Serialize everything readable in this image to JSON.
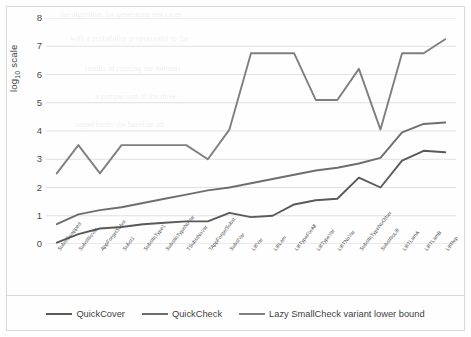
{
  "chart_data": {
    "type": "line",
    "title": "",
    "xlabel": "",
    "ylabel": "log10 scale",
    "ylabel_base": "log",
    "ylabel_sub": "10",
    "ylabel_rest": " scale",
    "ylim": [
      0,
      8
    ],
    "yticks": [
      0,
      1,
      2,
      3,
      4,
      5,
      6,
      7,
      8
    ],
    "grid": "horizontal",
    "legend_position": "bottom",
    "categories": [
      "SubstSwapped",
      "SubstNoVar",
      "AppForgetSubst",
      "Subst1",
      "SubstInType1",
      "SubstInTypeNoVar",
      "TSubstNoVar",
      "TAppForgetSubst",
      "SubstVar",
      "LiftVar",
      "LiftLam",
      "LiftTypeForAll",
      "LiftTypeVar",
      "LiftTNoVar",
      "SubstInTypeNoOther",
      "SubstNoLift",
      "LiftTLamA",
      "LiftTLamB",
      "LiftRep"
    ],
    "series": [
      {
        "name": "QuickCover",
        "values": [
          0.05,
          0.35,
          0.55,
          0.6,
          0.7,
          0.75,
          0.8,
          0.8,
          1.1,
          0.95,
          1.0,
          1.4,
          1.55,
          1.6,
          2.35,
          2.0,
          2.95,
          3.3,
          3.25
        ]
      },
      {
        "name": "QuickCheck",
        "values": [
          0.7,
          1.05,
          1.2,
          1.3,
          1.45,
          1.6,
          1.75,
          1.9,
          2.0,
          2.15,
          2.3,
          2.45,
          2.6,
          2.7,
          2.85,
          3.05,
          3.95,
          4.25,
          4.3
        ]
      },
      {
        "name": "Lazy SmallCheck variant lower bound",
        "values": [
          2.5,
          3.5,
          2.5,
          3.5,
          3.5,
          3.5,
          3.5,
          3.0,
          4.05,
          6.75,
          6.75,
          6.75,
          5.1,
          5.1,
          6.2,
          4.05,
          6.75,
          6.75,
          7.25
        ]
      }
    ],
    "series_colors": [
      "#595959",
      "#6e6e6e",
      "#7f7f7f"
    ],
    "gridline_color": "#d9d9d9",
    "axis_color": "#bfbfbf"
  },
  "legend": {
    "entries": [
      {
        "label": "QuickCover"
      },
      {
        "label": "QuickCheck"
      },
      {
        "label": "Lazy SmallCheck variant lower bound"
      }
    ]
  },
  "bleed_text": [
    "the algorithm for generating test cases",
    "with a probability proportional to the",
    "results of running the mutants",
    "a comparison of the three",
    "outperforms the baseline on"
  ]
}
